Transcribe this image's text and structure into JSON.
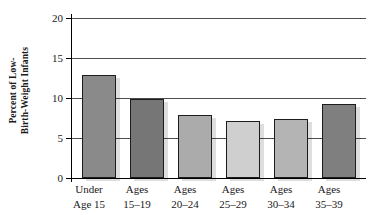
{
  "chart_data": {
    "type": "bar",
    "title": "",
    "subtitle": "",
    "xlabel": "",
    "ylabel": "Percent of Low-Birth-Weight Infants",
    "ylabel_lines": [
      "Percent of Low-",
      "Birth-Weight Infants"
    ],
    "categories": [
      "Under Age 15",
      "Ages 15–19",
      "Ages 20–24",
      "Ages 25–29",
      "Ages 30–34",
      "Ages 35–39"
    ],
    "category_lines": [
      [
        "Under",
        "Age 15"
      ],
      [
        "Ages",
        "15–19"
      ],
      [
        "Ages",
        "20–24"
      ],
      [
        "Ages",
        "25–29"
      ],
      [
        "Ages",
        "30–34"
      ],
      [
        "Ages",
        "35–39"
      ]
    ],
    "values": [
      12.9,
      9.9,
      7.9,
      7.1,
      7.4,
      9.2
    ],
    "bar_colors": [
      "#8a8a8a",
      "#767676",
      "#ababab",
      "#cfcfcf",
      "#b4b4b4",
      "#7f7f7f"
    ],
    "ylim": [
      0,
      20
    ],
    "yticks": [
      0,
      5,
      10,
      15,
      20
    ],
    "ytick_labels": [
      "0",
      "5",
      "10",
      "15",
      "20"
    ],
    "grid": true,
    "grid_values": [
      5,
      10,
      15,
      20
    ],
    "legend": null,
    "legend_position": "none",
    "annotations": [],
    "colors": {
      "axis": "#000000",
      "gridline": "#4d4d4d",
      "bar_border": "#1c1c1c",
      "background": "#ffffff",
      "text": "#1a1a1a"
    }
  }
}
